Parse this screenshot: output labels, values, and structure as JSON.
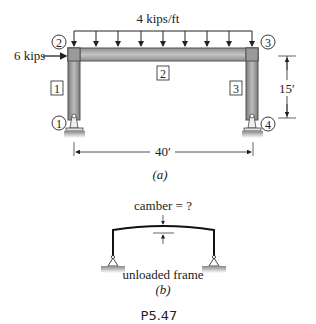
{
  "figure_a": {
    "load_label": "4 kips/ft",
    "horizontal_load_label": "6 kips",
    "nodes": [
      {
        "id": "1",
        "label": "1"
      },
      {
        "id": "2",
        "label": "2"
      },
      {
        "id": "3",
        "label": "3"
      },
      {
        "id": "4",
        "label": "4"
      }
    ],
    "members": [
      {
        "id": "1",
        "label": "1"
      },
      {
        "id": "2",
        "label": "2"
      },
      {
        "id": "3",
        "label": "3"
      }
    ],
    "height_dimension": "15′",
    "span_dimension": "40′",
    "caption": "(a)"
  },
  "figure_b": {
    "camber_label": "camber = ?",
    "description": "unloaded frame",
    "caption": "(b)"
  },
  "problem_number": "P5.47",
  "colors": {
    "member_fill": "#a9a9a9",
    "member_edge": "#555555",
    "line": "#222222",
    "ground": "#bdbdbd"
  }
}
